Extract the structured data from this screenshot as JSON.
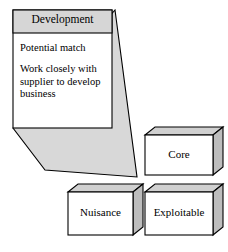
{
  "diagram": {
    "type": "supplier-relationship-matrix-callout",
    "callout": {
      "header": "Development",
      "body_lines": [
        "Potential match",
        "Work closely with supplier to develop business"
      ],
      "body_paragraph_1": "Potential match",
      "body_paragraph_2": "Work closely with supplier to develop business"
    },
    "boxes": [
      {
        "id": "core",
        "label": "Core"
      },
      {
        "id": "nuisance",
        "label": "Nuisance"
      },
      {
        "id": "exploitable",
        "label": "Exploitable"
      }
    ],
    "colors": {
      "background": "#ffffff",
      "outline": "#000000",
      "header_fill": "#d6d6d6",
      "callout_body_fill": "#ffffff",
      "funnel_fill": "#d8d8d8",
      "box_front_fill": "#ffffff",
      "box_top_fill": "#d0d0d0",
      "box_side_fill": "#bdbdbd",
      "text": "#000000"
    }
  }
}
